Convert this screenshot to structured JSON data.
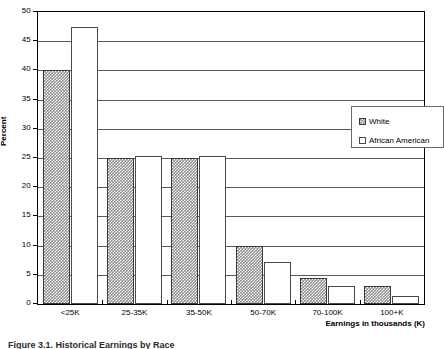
{
  "chart_data": {
    "type": "bar",
    "title": "",
    "xlabel": "Earnings in thousands (K)",
    "ylabel": "Percent",
    "categories": [
      "<25K",
      "25-35K",
      "35-50K",
      "50-70K",
      "70-100K",
      "100+K"
    ],
    "series": [
      {
        "name": "White",
        "values": [
          40,
          25,
          25,
          10,
          4.5,
          3
        ]
      },
      {
        "name": "African American",
        "values": [
          47.5,
          25.3,
          25.3,
          7.2,
          3,
          1.3
        ]
      }
    ],
    "ylim": [
      0,
      50
    ],
    "yticks": [
      0,
      5,
      10,
      15,
      20,
      25,
      30,
      35,
      40,
      45,
      50
    ],
    "ytick_labels": [
      "0",
      "5",
      "10",
      "15",
      "20",
      "25",
      "30",
      "35",
      "40",
      "45",
      "50"
    ],
    "grid": "horizontal",
    "legend_position": "upper-right",
    "legend_entries": [
      "White",
      "African American"
    ],
    "colors": {
      "white_series_fill": "#8f8f8f",
      "white_series_pattern": "#ffffff",
      "african_american_series_fill": "#ffffff",
      "border": "#000000",
      "gridline": "#5a5a5a"
    }
  },
  "caption": {
    "text": "Figure 3.1.  Historical Earnings by Race"
  }
}
